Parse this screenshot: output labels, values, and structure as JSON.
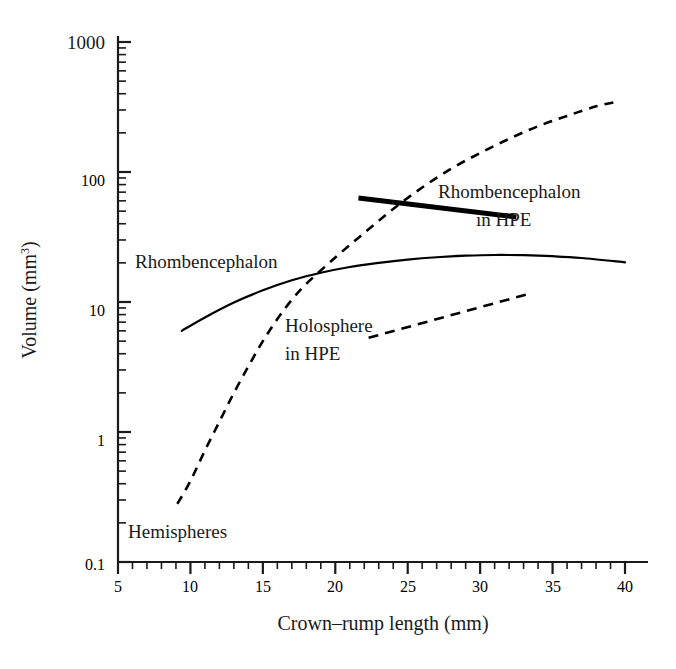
{
  "chart_data": {
    "type": "line",
    "title": "",
    "xlabel": "Crown–rump length (mm)",
    "ylabel": "Volume (mm³)",
    "ylabel_base": "Volume (mm",
    "ylabel_exp": "3",
    "ylabel_tail": ")",
    "xlim": [
      5,
      40
    ],
    "ylim": [
      0.1,
      1000
    ],
    "yscale": "log",
    "xscale": "linear",
    "grid": false,
    "legend": "inline-annotations",
    "xticks": [
      5,
      10,
      15,
      20,
      25,
      30,
      35,
      40
    ],
    "xticklabels": [
      "5",
      "10",
      "15",
      "20",
      "25",
      "30",
      "35",
      "40"
    ],
    "yticks": [
      0.1,
      1,
      10,
      100,
      1000
    ],
    "yticklabels": [
      "0.1",
      "1",
      "10",
      "100",
      "1000"
    ],
    "yminorticks_per_decade": 8,
    "xminortick_step": 1,
    "series": [
      {
        "name": "Rhombencephalon",
        "style": "solid",
        "linewidth": 2.2,
        "color": "#000000",
        "x": [
          9.4,
          11.0,
          13.0,
          15.0,
          17.0,
          19.0,
          21.0,
          23.0,
          25.0,
          27.0,
          29.0,
          31.0,
          33.0,
          35.0,
          37.0,
          40.0
        ],
        "y": [
          6.0,
          7.6,
          9.9,
          12.3,
          14.7,
          16.8,
          18.6,
          20.0,
          21.2,
          22.1,
          22.7,
          23.0,
          22.9,
          22.5,
          21.8,
          20.2
        ]
      },
      {
        "name": "Hemispheres",
        "style": "dashed",
        "linewidth": 2.6,
        "color": "#000000",
        "x": [
          9.1,
          10.0,
          11.0,
          12.0,
          13.0,
          14.0,
          15.0,
          16.0,
          17.0,
          18.0,
          20.0,
          22.0,
          24.0,
          26.0,
          28.0,
          30.0,
          32.0,
          34.0,
          36.0,
          38.0,
          39.6
        ],
        "y": [
          0.28,
          0.42,
          0.72,
          1.2,
          2.0,
          3.2,
          5.0,
          7.4,
          10.4,
          13.8,
          22.0,
          34.0,
          52.0,
          76.0,
          106.0,
          140.0,
          180.0,
          225.0,
          270.0,
          320.0,
          350.0
        ]
      },
      {
        "name": "Rhombencephalon in HPE",
        "style": "solid-thick",
        "linewidth": 5.0,
        "color": "#000000",
        "x": [
          21.6,
          32.5
        ],
        "y": [
          63.0,
          45.0
        ]
      },
      {
        "name": "Holosphere in HPE",
        "style": "dashed",
        "linewidth": 2.6,
        "color": "#000000",
        "x": [
          22.3,
          33.3
        ],
        "y": [
          5.3,
          11.5
        ]
      }
    ],
    "annotations": [
      {
        "id": "rhombencephalon-label",
        "text": "Rhombencephalon",
        "lines": [
          "Rhombencephalon"
        ],
        "x_px": 135,
        "y_px": 262,
        "anchor": "start"
      },
      {
        "id": "rhombencephalon-hpe-label",
        "text": "Rhombencephalon in HPE",
        "lines": [
          "Rhombencephalon",
          "in HPE"
        ],
        "x_px": 438,
        "y_px": 198,
        "anchor": "start"
      },
      {
        "id": "holosphere-hpe-label",
        "text": "Holosphere in HPE",
        "lines": [
          "Holosphere",
          "in HPE"
        ],
        "x_px": 285,
        "y_px": 327,
        "anchor": "start"
      },
      {
        "id": "hemispheres-label",
        "text": "Hemispheres",
        "lines": [
          "Hemispheres"
        ],
        "x_px": 128,
        "y_px": 533,
        "anchor": "start"
      }
    ]
  },
  "axes": {
    "x_axis_title": "Crown–rump length (mm)",
    "y_axis_title_base": "Volume (mm",
    "y_axis_title_exp": "3",
    "y_axis_title_tail": ")"
  },
  "labels": {
    "y_1000": "1000",
    "y_100": "100",
    "y_10": "10",
    "y_1": "1",
    "y_01": "0.1",
    "x_5": "5",
    "x_10": "10",
    "x_15": "15",
    "x_20": "20",
    "x_25": "25",
    "x_30": "30",
    "x_35": "35",
    "x_40": "40",
    "s_rhombencephalon": "Rhombencephalon",
    "s_rhomb_hpe_1": "Rhombencephalon",
    "s_rhomb_hpe_2": "in HPE",
    "s_holosphere_1": "Holosphere",
    "s_holosphere_2": "in HPE",
    "s_hemispheres": "Hemispheres"
  },
  "colors": {
    "ink": "#1a1a1a",
    "curve": "#000000",
    "background": "#ffffff"
  }
}
